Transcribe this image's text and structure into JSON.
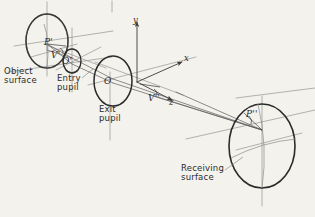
{
  "figure": {
    "background_color": "#f4f2ed",
    "ink_color": "#3a3a3a",
    "pencil_color": "#6e6e6e"
  },
  "labels": {
    "object_surface": "Object\nsurface",
    "entry_pupil": "Entry\npupil",
    "exit_pupil": "Exit\npupil",
    "receiving_surface": "Receiving\nsurface"
  },
  "points": {
    "p_object": "P'",
    "v_object": "V'",
    "o_entry": "O'",
    "o_exit": "O",
    "v_exit": "V''",
    "p_receiving": "P''"
  },
  "axes": {
    "x": "x",
    "y": "y",
    "z": "z"
  }
}
